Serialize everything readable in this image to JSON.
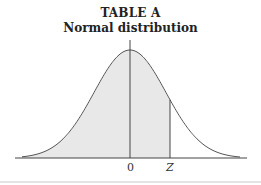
{
  "header": {
    "title": "TABLE A",
    "subtitle": "Normal distribution"
  },
  "axis": {
    "labels": [
      "0",
      "Z"
    ]
  },
  "colors": {
    "shade": "#e8e8e8",
    "curve": "#555555"
  },
  "chart_data": {
    "type": "area",
    "x_ticks": [
      "0",
      "Z"
    ],
    "shaded_region": {
      "from": "-inf",
      "to": "Z"
    },
    "z_value_approx": 0.85,
    "xlabel": "",
    "ylabel": "",
    "grid": false
  }
}
